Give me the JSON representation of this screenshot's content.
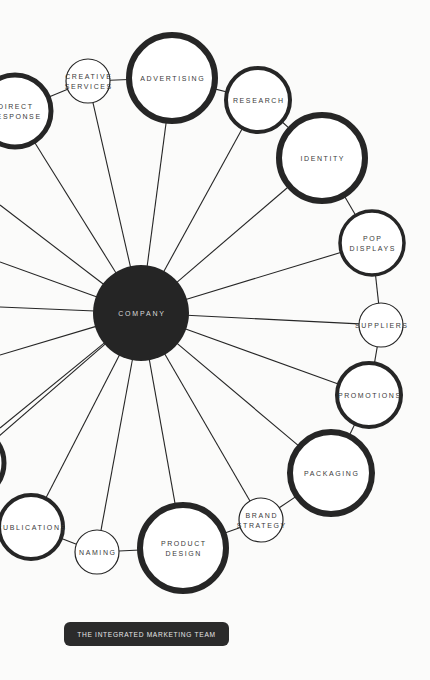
{
  "diagram": {
    "title": "The Integrated Marketing Team",
    "hub": {
      "label": "COMPANY",
      "cx": 141,
      "cy": 313,
      "r": 48,
      "color": "#252525"
    },
    "nodes": [
      {
        "id": "direct-response",
        "lines": [
          "DIRECT",
          "RESPONSE"
        ],
        "cx": 15,
        "cy": 111,
        "r": 36,
        "stroke": 5
      },
      {
        "id": "creative-services",
        "lines": [
          "CREATIVE",
          "SERVICES"
        ],
        "cx": 88,
        "cy": 81,
        "r": 22,
        "stroke": 1.2
      },
      {
        "id": "advertising",
        "lines": [
          "ADVERTISING"
        ],
        "cx": 172,
        "cy": 78,
        "r": 43,
        "stroke": 6
      },
      {
        "id": "research",
        "lines": [
          "RESEARCH"
        ],
        "cx": 258,
        "cy": 100,
        "r": 32,
        "stroke": 4
      },
      {
        "id": "identity",
        "lines": [
          "IDENTITY"
        ],
        "cx": 322,
        "cy": 158,
        "r": 43,
        "stroke": 6
      },
      {
        "id": "pop-displays",
        "lines": [
          "POP",
          "DISPLAYS"
        ],
        "cx": 372,
        "cy": 243,
        "r": 32,
        "stroke": 3.5
      },
      {
        "id": "suppliers",
        "lines": [
          "SUPPLIERS"
        ],
        "cx": 381,
        "cy": 325,
        "r": 22,
        "stroke": 1.2
      },
      {
        "id": "promotions",
        "lines": [
          "PROMOTIONS"
        ],
        "cx": 369,
        "cy": 395,
        "r": 32,
        "stroke": 4
      },
      {
        "id": "packaging",
        "lines": [
          "PACKAGING"
        ],
        "cx": 331,
        "cy": 473,
        "r": 41,
        "stroke": 6
      },
      {
        "id": "brand-strategy",
        "lines": [
          "BRAND",
          "STRATEGY"
        ],
        "cx": 261,
        "cy": 520,
        "r": 22,
        "stroke": 1.2
      },
      {
        "id": "product-design",
        "lines": [
          "PRODUCT",
          "DESIGN"
        ],
        "cx": 183,
        "cy": 548,
        "r": 43,
        "stroke": 6
      },
      {
        "id": "naming",
        "lines": [
          "NAMING"
        ],
        "cx": 97,
        "cy": 552,
        "r": 22,
        "stroke": 1.2
      },
      {
        "id": "publications",
        "lines": [
          "PUBLICATIONS"
        ],
        "cx": 31,
        "cy": 527,
        "r": 32,
        "stroke": 4
      },
      {
        "id": "offscreen-node",
        "lines": [],
        "cx": -32,
        "cy": 463,
        "r": 36,
        "stroke": 5
      }
    ],
    "ring_links": [
      [
        "direct-response",
        "creative-services"
      ],
      [
        "creative-services",
        "advertising"
      ],
      [
        "advertising",
        "research"
      ],
      [
        "research",
        "identity"
      ],
      [
        "identity",
        "pop-displays"
      ],
      [
        "pop-displays",
        "suppliers"
      ],
      [
        "suppliers",
        "promotions"
      ],
      [
        "promotions",
        "packaging"
      ],
      [
        "packaging",
        "brand-strategy"
      ],
      [
        "brand-strategy",
        "product-design"
      ],
      [
        "product-design",
        "naming"
      ],
      [
        "naming",
        "publications"
      ]
    ],
    "offscreen_spokes": [
      {
        "x": 0,
        "y": 205
      },
      {
        "x": 0,
        "y": 262
      },
      {
        "x": 0,
        "y": 307
      },
      {
        "x": 0,
        "y": 355
      },
      {
        "x": 0,
        "y": 428
      }
    ],
    "colors": {
      "ink": "#262626",
      "background": "#fbfbfa",
      "label": "#3a3a3a",
      "hub_label": "#d8d8d8"
    }
  },
  "caption": {
    "label": "THE INTEGRATED MARKETING TEAM"
  }
}
